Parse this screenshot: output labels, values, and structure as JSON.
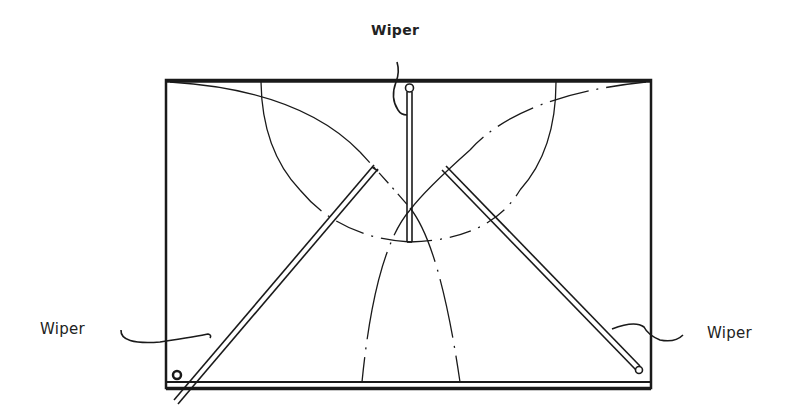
{
  "diagram": {
    "labels": {
      "top": "Wiper",
      "left": "Wiper",
      "right": "Wiper"
    },
    "colors": {
      "line": "#1a1a1a",
      "background": "#ffffff"
    }
  }
}
